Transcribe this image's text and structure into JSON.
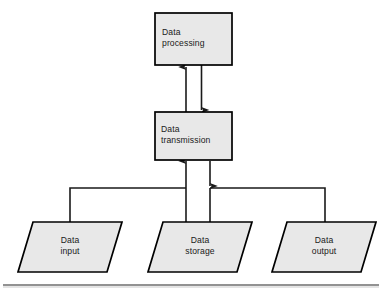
{
  "diagram": {
    "type": "flowchart",
    "style": {
      "shape_fill": "#e8e8e8",
      "shape_stroke": "#000000",
      "connector_stroke": "#1a1a1a",
      "background": "#ffffff",
      "rule_color": "#888888"
    },
    "nodes": [
      {
        "id": "data-processing",
        "shape": "rectangle",
        "line1": "Data",
        "line2": "processing",
        "x": 155,
        "y": 13,
        "width": 77,
        "height": 52
      },
      {
        "id": "data-transmission",
        "shape": "rectangle",
        "line1": "Data",
        "line2": "transmission",
        "x": 155,
        "y": 112,
        "width": 77,
        "height": 48
      },
      {
        "id": "data-input",
        "shape": "parallelogram",
        "line1": "Data",
        "line2": "input",
        "x": 18,
        "y": 222,
        "width": 104,
        "height": 50
      },
      {
        "id": "data-storage",
        "shape": "parallelogram",
        "line1": "Data",
        "line2": "storage",
        "x": 148,
        "y": 222,
        "width": 104,
        "height": 50
      },
      {
        "id": "data-output",
        "shape": "parallelogram",
        "line1": "Data",
        "line2": "output",
        "x": 272,
        "y": 222,
        "width": 104,
        "height": 50
      }
    ],
    "connectors": [
      {
        "id": "transmission-to-processing",
        "from": "data-transmission",
        "to": "data-processing",
        "arrow": "up"
      },
      {
        "id": "processing-to-transmission",
        "from": "data-processing",
        "to": "data-transmission",
        "arrow": "down"
      },
      {
        "id": "input-storage-bus-to-transmission",
        "from": "data-input",
        "to": "data-transmission",
        "arrow": "up"
      },
      {
        "id": "transmission-to-storage-output-bus",
        "from": "data-transmission",
        "to": "data-output",
        "arrow": "down"
      }
    ],
    "footer_rule": {
      "y": 285,
      "x1": 3,
      "x2": 379
    }
  }
}
